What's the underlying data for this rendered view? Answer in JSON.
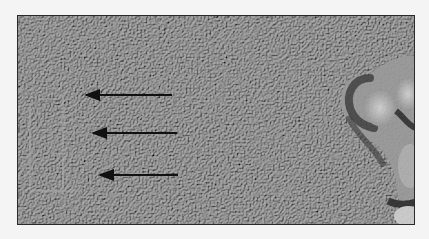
{
  "image": {
    "description": "Grayscale textured micrograph with a rounded lobed structure at the right edge",
    "background_color": "#f4f4f4",
    "texture_base_color": "#7a7a7a",
    "structure_color_light": "#c8c8c8",
    "structure_color_dark": "#3a3a3a",
    "arrow_color": "#111111"
  },
  "arrows": [
    {
      "x1": 172,
      "y1": 95,
      "x2": 86,
      "y2": 95,
      "direction": "left"
    },
    {
      "x1": 177,
      "y1": 133,
      "x2": 93,
      "y2": 133,
      "direction": "left"
    },
    {
      "x1": 178,
      "y1": 175,
      "x2": 100,
      "y2": 175,
      "direction": "left"
    }
  ]
}
